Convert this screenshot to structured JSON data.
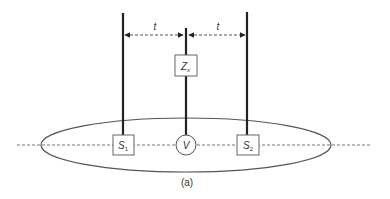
{
  "diagram": {
    "caption": "(a)",
    "spacing_label_left": "t",
    "spacing_label_right": "t",
    "impedance": {
      "label": "Z",
      "subscript": "x"
    },
    "source_left": {
      "label": "S",
      "subscript": "1"
    },
    "source_right": {
      "label": "S",
      "subscript": "2"
    },
    "voltmeter": {
      "label": "V"
    },
    "colors": {
      "line": "#222222",
      "outline": "#555555",
      "dash": "#777777"
    }
  }
}
